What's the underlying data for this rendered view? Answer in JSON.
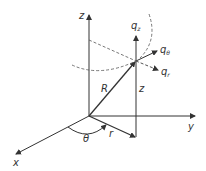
{
  "diagram": {
    "axes": {
      "x_label": "x",
      "y_label": "y",
      "z_label": "z"
    },
    "labels": {
      "R": "R",
      "r": "r",
      "theta": "θ",
      "z_height": "z",
      "q_z_base": "q",
      "q_z_sub": "z",
      "q_theta_base": "q",
      "q_theta_sub": "θ",
      "q_r_base": "q",
      "q_r_sub": "r"
    },
    "colors": {
      "line": "#333333",
      "dashed": "#555555",
      "background": "#ffffff"
    }
  }
}
